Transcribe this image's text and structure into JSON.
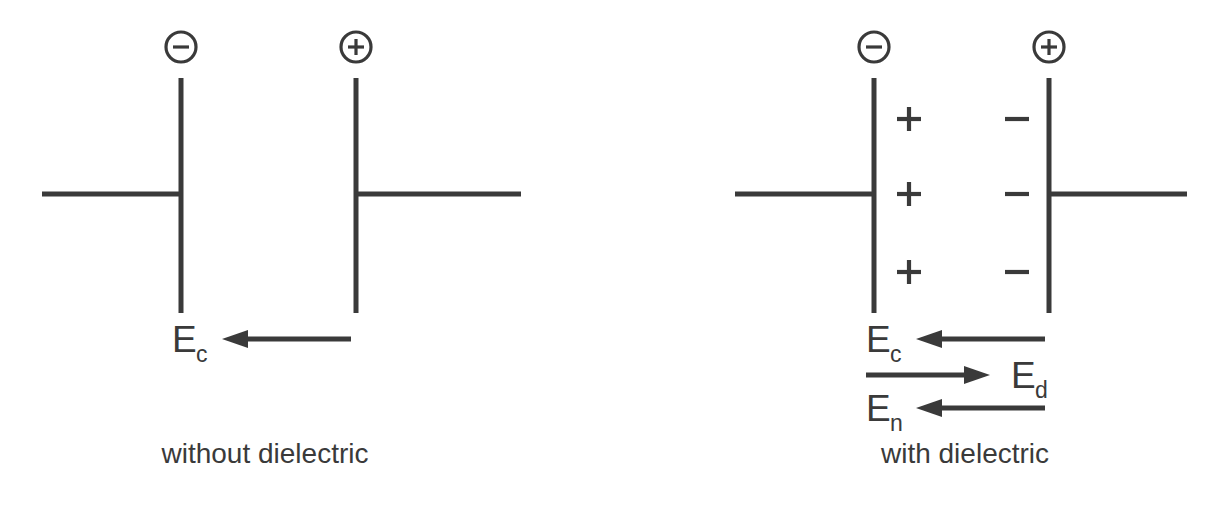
{
  "figure": {
    "background_color": "#ffffff",
    "line_color": "#3a3a3a",
    "width": 1216,
    "height": 505
  },
  "panels": [
    {
      "id": "without-dielectric",
      "caption": "without dielectric",
      "terminals": [
        {
          "id": "negative-terminal",
          "symbol": "−",
          "icon": "minus-circle-icon",
          "cx": 181,
          "cy": 47,
          "r": 15
        },
        {
          "id": "positive-terminal",
          "symbol": "+",
          "icon": "plus-circle-icon",
          "cx": 356,
          "cy": 47,
          "r": 15
        }
      ],
      "plates": [
        {
          "id": "left-plate",
          "x": 181,
          "y1": 78,
          "y2": 313
        },
        {
          "id": "right-plate",
          "x": 356,
          "y1": 78,
          "y2": 313
        }
      ],
      "wires": [
        {
          "id": "left-wire",
          "x1": 42,
          "x2": 181,
          "y": 194
        },
        {
          "id": "right-wire",
          "x1": 356,
          "x2": 521,
          "y": 194
        }
      ],
      "dielectric_charges": [],
      "field_arrows": [
        {
          "id": "Ec-arrow",
          "label": "E",
          "subscript": "c",
          "direction": "left",
          "y": 339,
          "tail_x": 351,
          "head_x": 222,
          "label_x": 172,
          "label_y": 352,
          "sub_x": 196,
          "sub_y": 362
        }
      ]
    },
    {
      "id": "with-dielectric",
      "caption": "with dielectric",
      "terminals": [
        {
          "id": "negative-terminal",
          "symbol": "−",
          "icon": "minus-circle-icon",
          "cx": 874,
          "cy": 47,
          "r": 15
        },
        {
          "id": "positive-terminal",
          "symbol": "+",
          "icon": "plus-circle-icon",
          "cx": 1049,
          "cy": 47,
          "r": 15
        }
      ],
      "plates": [
        {
          "id": "left-plate",
          "x": 874,
          "y1": 78,
          "y2": 313
        },
        {
          "id": "right-plate",
          "x": 1049,
          "y1": 78,
          "y2": 313
        }
      ],
      "wires": [
        {
          "id": "left-wire",
          "x1": 735,
          "x2": 874,
          "y": 194
        },
        {
          "id": "right-wire",
          "x1": 1049,
          "x2": 1187,
          "y": 194
        }
      ],
      "dielectric_charges": [
        {
          "id": "induced-positive-1",
          "sign": "+",
          "cx": 909,
          "cy": 119
        },
        {
          "id": "induced-positive-2",
          "sign": "+",
          "cx": 909,
          "cy": 194
        },
        {
          "id": "induced-positive-3",
          "sign": "+",
          "cx": 909,
          "cy": 272
        },
        {
          "id": "induced-negative-1",
          "sign": "−",
          "cx": 1017,
          "cy": 119
        },
        {
          "id": "induced-negative-2",
          "sign": "−",
          "cx": 1017,
          "cy": 194
        },
        {
          "id": "induced-negative-3",
          "sign": "−",
          "cx": 1017,
          "cy": 272
        }
      ],
      "field_arrows": [
        {
          "id": "Ec-arrow",
          "label": "E",
          "subscript": "c",
          "direction": "left",
          "y": 339,
          "tail_x": 1045,
          "head_x": 916,
          "label_x": 866,
          "label_y": 352,
          "sub_x": 890,
          "sub_y": 362
        },
        {
          "id": "Ed-arrow",
          "label": "E",
          "subscript": "d",
          "direction": "right",
          "y": 375,
          "tail_x": 866,
          "head_x": 990,
          "label_x": 1011,
          "label_y": 388,
          "sub_x": 1035,
          "sub_y": 398
        },
        {
          "id": "En-arrow",
          "label": "E",
          "subscript": "n",
          "direction": "left",
          "y": 408,
          "tail_x": 1045,
          "head_x": 916,
          "label_x": 866,
          "label_y": 421,
          "sub_x": 890,
          "sub_y": 431
        }
      ]
    }
  ],
  "captions": {
    "left": {
      "text": "without dielectric",
      "x": 265,
      "y": 463
    },
    "right": {
      "text": "with dielectric",
      "x": 965,
      "y": 463
    }
  }
}
